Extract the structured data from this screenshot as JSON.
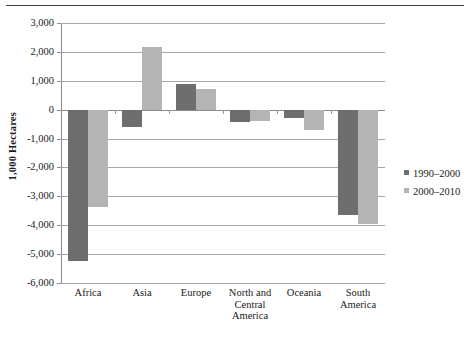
{
  "chart_data": {
    "type": "bar",
    "title": "",
    "subtitle": "",
    "xlabel": "",
    "ylabel": "1,000 Hectares",
    "categories": [
      "Africa",
      "Asia",
      "Europe",
      "North and\nCentral\nAmerica",
      "Oceania",
      "South\nAmerica"
    ],
    "ylim": [
      -6000,
      3000
    ],
    "ytick_labels": [
      "3,000",
      "2,000",
      "1,000",
      "0",
      "-1,000",
      "-2,000",
      "-3,000",
      "-4,000",
      "-5,000",
      "-6,000"
    ],
    "ytick_values": [
      3000,
      2000,
      1000,
      0,
      -1000,
      -2000,
      -3000,
      -4000,
      -5000,
      -6000
    ],
    "grid": true,
    "legend_position": "right",
    "series": [
      {
        "name": "1990–2000",
        "color": "#6e6e6e",
        "values": [
          -5250,
          -600,
          880,
          -430,
          -280,
          -3650
        ]
      },
      {
        "name": "2000–2010",
        "color": "#b4b4b4",
        "values": [
          -3370,
          2180,
          700,
          -400,
          -700,
          -3970
        ]
      }
    ]
  },
  "figure": {
    "top_rule": "horizontal-rule",
    "axis_color": "#8c8c8c",
    "grid_color": "#a8a8a8",
    "background": "#ffffff"
  }
}
